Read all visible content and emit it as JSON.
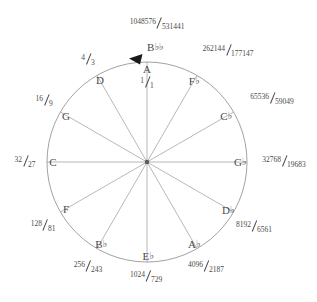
{
  "diagram": {
    "type": "circle-of-fifths",
    "geometry": {
      "center_x": 147,
      "center_y": 162,
      "radius": 100,
      "stroke_color": "#8a8a8a",
      "spoke_color": "#9a9a9a",
      "text_color": "#4a4a4a",
      "background": "#ffffff"
    },
    "arrow": {
      "name": "direction-arrowhead",
      "direction": "counterclockwise",
      "angle_deg": 100
    },
    "tonic": {
      "note": "A",
      "ratio_num": "1",
      "ratio_den": "1",
      "ratio_text": "1/1"
    },
    "nodes": [
      {
        "note_base": "A",
        "accidental": "",
        "ratio_num": "1",
        "ratio_den": "1",
        "angle_deg": 90
      },
      {
        "note_base": "D",
        "accidental": "",
        "ratio_num": "4",
        "ratio_den": "3",
        "angle_deg": 120
      },
      {
        "note_base": "G",
        "accidental": "",
        "ratio_num": "16",
        "ratio_den": "9",
        "angle_deg": 150
      },
      {
        "note_base": "C",
        "accidental": "",
        "ratio_num": "32",
        "ratio_den": "27",
        "angle_deg": 180
      },
      {
        "note_base": "F",
        "accidental": "",
        "ratio_num": "128",
        "ratio_den": "81",
        "angle_deg": 210
      },
      {
        "note_base": "B",
        "accidental": "♭",
        "ratio_num": "256",
        "ratio_den": "243",
        "angle_deg": 240
      },
      {
        "note_base": "E",
        "accidental": "♭",
        "ratio_num": "1024",
        "ratio_den": "729",
        "angle_deg": 270
      },
      {
        "note_base": "A",
        "accidental": "♭",
        "ratio_num": "4096",
        "ratio_den": "2187",
        "angle_deg": 300
      },
      {
        "note_base": "D",
        "accidental": "♭",
        "ratio_num": "8192",
        "ratio_den": "6561",
        "angle_deg": 330
      },
      {
        "note_base": "G",
        "accidental": "♭",
        "ratio_num": "32768",
        "ratio_den": "19683",
        "angle_deg": 0
      },
      {
        "note_base": "C",
        "accidental": "♭",
        "ratio_num": "65536",
        "ratio_den": "59049",
        "angle_deg": 30
      },
      {
        "note_base": "F",
        "accidental": "♭",
        "ratio_num": "262144",
        "ratio_den": "177147",
        "angle_deg": 60
      },
      {
        "note_base": "B",
        "accidental": "♭♭",
        "ratio_num": "1048576",
        "ratio_den": "531441",
        "angle_deg": 90
      }
    ]
  }
}
